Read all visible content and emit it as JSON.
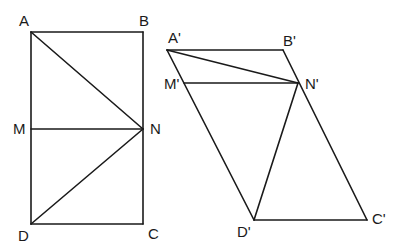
{
  "figure_left": {
    "name": "rectangle ABCD",
    "points": {
      "A": {
        "label": "A",
        "x": 31,
        "y": 32
      },
      "B": {
        "label": "B",
        "x": 143,
        "y": 32
      },
      "C": {
        "label": "C",
        "x": 143,
        "y": 224
      },
      "D": {
        "label": "D",
        "x": 31,
        "y": 224
      },
      "M": {
        "label": "M",
        "x": 31,
        "y": 129
      },
      "N": {
        "label": "N",
        "x": 143,
        "y": 129
      }
    },
    "segments": [
      [
        "A",
        "B"
      ],
      [
        "B",
        "C"
      ],
      [
        "C",
        "D"
      ],
      [
        "D",
        "A"
      ],
      [
        "M",
        "N"
      ],
      [
        "A",
        "N"
      ],
      [
        "D",
        "N"
      ]
    ]
  },
  "figure_right": {
    "name": "parallelogram A'B'C'D'",
    "points": {
      "A": {
        "label": "A'",
        "x": 167,
        "y": 50
      },
      "B": {
        "label": "B'",
        "x": 283,
        "y": 50
      },
      "C": {
        "label": "C'",
        "x": 367,
        "y": 220
      },
      "D": {
        "label": "D'",
        "x": 254,
        "y": 220
      },
      "M": {
        "label": "M'",
        "x": 186,
        "y": 83
      },
      "N": {
        "label": "N'",
        "x": 298,
        "y": 83
      }
    },
    "segments": [
      [
        "A",
        "B"
      ],
      [
        "B",
        "C"
      ],
      [
        "C",
        "D"
      ],
      [
        "D",
        "A"
      ],
      [
        "M",
        "N"
      ],
      [
        "A",
        "N"
      ],
      [
        "D",
        "N"
      ]
    ]
  },
  "labels": {
    "A": "A",
    "B": "B",
    "C": "C",
    "D": "D",
    "M": "M",
    "N": "N",
    "A_prime": "A'",
    "B_prime": "B'",
    "C_prime": "C'",
    "D_prime": "D'",
    "M_prime": "M'",
    "N_prime": "N'"
  },
  "colors": {
    "stroke": "#1a1a1a",
    "background": "#ffffff"
  }
}
